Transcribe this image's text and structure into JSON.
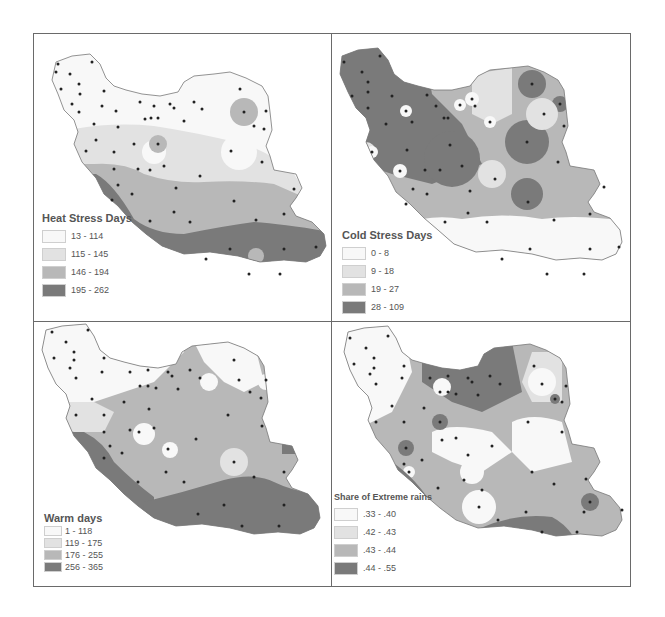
{
  "figure": {
    "panels": [
      {
        "id": "heat-stress",
        "title": "Heat Stress Days",
        "classes": [
          {
            "label": "13 - 114",
            "color": "#f8f8f8"
          },
          {
            "label": "115 - 145",
            "color": "#e2e2e2"
          },
          {
            "label": "146 - 194",
            "color": "#b8b8b8"
          },
          {
            "label": "195 - 262",
            "color": "#7a7a7a"
          }
        ]
      },
      {
        "id": "cold-stress",
        "title": "Cold Stress Days",
        "classes": [
          {
            "label": "0 - 8",
            "color": "#f8f8f8"
          },
          {
            "label": "9 - 18",
            "color": "#e2e2e2"
          },
          {
            "label": "19 - 27",
            "color": "#b8b8b8"
          },
          {
            "label": "28 - 109",
            "color": "#7a7a7a"
          }
        ]
      },
      {
        "id": "warm-days",
        "title": "Warm days",
        "classes": [
          {
            "label": "1 - 118",
            "color": "#f8f8f8"
          },
          {
            "label": "119 - 175",
            "color": "#e2e2e2"
          },
          {
            "label": "176 - 255",
            "color": "#b8b8b8"
          },
          {
            "label": "256 - 365",
            "color": "#7a7a7a"
          }
        ]
      },
      {
        "id": "extreme-rains",
        "title": "Share of Extreme rains",
        "classes": [
          {
            "label": ".33 - .40",
            "color": "#f8f8f8"
          },
          {
            "label": ".42 - .43",
            "color": "#e2e2e2"
          },
          {
            "label": ".43 - .44",
            "color": "#b8b8b8"
          },
          {
            "label": ".44 - .55",
            "color": "#7a7a7a"
          }
        ]
      }
    ]
  }
}
